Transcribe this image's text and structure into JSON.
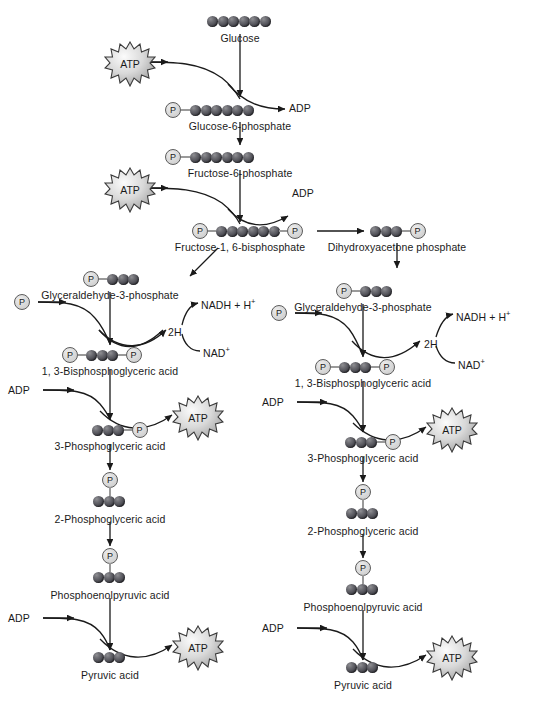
{
  "diagram": {
    "colors": {
      "sphere_dark": "#2e2e34",
      "sphere_light": "#8f8f93",
      "phosphate_fill": "#dcdcdc",
      "phosphate_stroke": "#5c5c5c",
      "line": "#1a1a1a",
      "bond": "#9a9a9a",
      "background": "#ffffff"
    },
    "metabolites": [
      {
        "id": "glucose",
        "label": "Glucose",
        "spheres": 6,
        "phosphate_left": false,
        "phosphate_right": false
      },
      {
        "id": "glucose-6-phosphate",
        "label": "Glucose-6-phosphate",
        "spheres": 6,
        "phosphate_left": true,
        "phosphate_right": false
      },
      {
        "id": "fructose-6-phosphate",
        "label": "Fructose-6-phosphate",
        "spheres": 6,
        "phosphate_left": true,
        "phosphate_right": false
      },
      {
        "id": "fructose-1-6-bisphosphate",
        "label": "Fructose-1, 6-bisphosphate",
        "spheres": 6,
        "phosphate_left": true,
        "phosphate_right": true
      },
      {
        "id": "dihydroxyacetone-phosphate",
        "label": "Dihydroxyacetone phosphate",
        "spheres": 3,
        "phosphate_left": false,
        "phosphate_right": true
      },
      {
        "id": "glyceraldehyde-3-phosphate-left",
        "label": "Glyceraldehyde-3-phosphate",
        "spheres": 3,
        "phosphate_left": true,
        "phosphate_right": false
      },
      {
        "id": "glyceraldehyde-3-phosphate-right",
        "label": "Glyceraldehyde-3-phosphate",
        "spheres": 3,
        "phosphate_left": true,
        "phosphate_right": false
      },
      {
        "id": "bisphosphoglyceric-left",
        "label": "1, 3-Bisphosphoglyceric acid",
        "spheres": 3,
        "phosphate_left": true,
        "phosphate_right": true
      },
      {
        "id": "bisphosphoglyceric-right",
        "label": "1, 3-Bisphosphoglyceric acid",
        "spheres": 3,
        "phosphate_left": true,
        "phosphate_right": true
      },
      {
        "id": "3-phosphoglyceric-left",
        "label": "3-Phosphoglyceric acid",
        "spheres": 3,
        "phosphate_left": false,
        "phosphate_right": true
      },
      {
        "id": "3-phosphoglyceric-right",
        "label": "3-Phosphoglyceric acid",
        "spheres": 3,
        "phosphate_left": false,
        "phosphate_right": true
      },
      {
        "id": "2-phosphoglyceric-left",
        "label": "2-Phosphoglyceric acid",
        "spheres": 3,
        "phosphate_top": true
      },
      {
        "id": "2-phosphoglyceric-right",
        "label": "2-Phosphoglyceric acid",
        "spheres": 3,
        "phosphate_top": true
      },
      {
        "id": "phosphoenolpyruvic-left",
        "label": "Phosphoenolpyruvic acid",
        "spheres": 3,
        "phosphate_top": true
      },
      {
        "id": "phosphoenolpyruvic-right",
        "label": "Phosphoenolpyruvic acid",
        "spheres": 3,
        "phosphate_top": true
      },
      {
        "id": "pyruvic-left",
        "label": "Pyruvic acid",
        "spheres": 3
      },
      {
        "id": "pyruvic-right",
        "label": "Pyruvic acid",
        "spheres": 3
      }
    ],
    "cofactors": {
      "atp": "ATP",
      "adp": "ADP",
      "phosphate_symbol": "P",
      "two_h": "2H",
      "nadh": "NADH + H",
      "nadh_sup": "+",
      "nad": "NAD",
      "nad_sup": "+"
    },
    "labels": {
      "glucose": "Glucose",
      "glucose6p": "Glucose-6-phosphate",
      "fructose6p": "Fructose-6-phosphate",
      "fructose16bp": "Fructose-1, 6-bisphosphate",
      "dhap": "Dihydroxyacetone phosphate",
      "g3p_left": "Glyceraldehyde-3-phosphate",
      "g3p_right": "Glyceraldehyde-3-phosphate",
      "bpg_left": "1, 3-Bisphosphoglyceric acid",
      "bpg_right": "1, 3-Bisphosphoglyceric acid",
      "pg3_left": "3-Phosphoglyceric acid",
      "pg3_right": "3-Phosphoglyceric acid",
      "pg2_left": "2-Phosphoglyceric acid",
      "pg2_right": "2-Phosphoglyceric acid",
      "pep_left": "Phosphoenolpyruvic acid",
      "pep_right": "Phosphoenolpyruvic acid",
      "pyr_left": "Pyruvic acid",
      "pyr_right": "Pyruvic acid",
      "adp1": "ADP",
      "adp2": "ADP",
      "adp_l1": "ADP",
      "adp_l2": "ADP",
      "adp_r1": "ADP",
      "adp_r2": "ADP",
      "atp1": "ATP",
      "atp2": "ATP",
      "atp_l1": "ATP",
      "atp_l2": "ATP",
      "atp_r1": "ATP",
      "atp_r2": "ATP",
      "twoh_left": "2H",
      "twoh_right": "2H",
      "nadh_left": "NADH + H",
      "nadh_right": "NADH + H",
      "nad_left": "NAD",
      "nad_right": "NAD",
      "p_left": "P",
      "p_right": "P"
    }
  }
}
